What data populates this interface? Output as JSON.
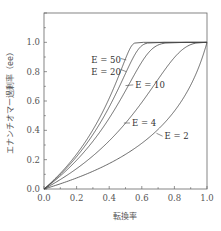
{
  "chart_data": {
    "type": "line",
    "title": "",
    "xlabel": "転換率",
    "ylabel": "エナンチオマー過剰率（ee）",
    "xlim": [
      0.0,
      1.0
    ],
    "ylim": [
      0.0,
      1.2
    ],
    "xticks": [
      "0.0",
      "0.2",
      "0.4",
      "0.6",
      "0.8",
      "1.0"
    ],
    "yticks": [
      "0.0",
      "0.2",
      "0.4",
      "0.6",
      "0.8",
      "1.0"
    ],
    "grid": false,
    "legend": "inline labels",
    "series": [
      {
        "name": "E = 50",
        "E": 50,
        "x": [
          0,
          0.063,
          0.154,
          0.243,
          0.331,
          0.419,
          0.508,
          0.551,
          0.574,
          0.6,
          1.0
        ],
        "y": [
          0,
          0.1,
          0.25,
          0.4,
          0.55,
          0.7,
          0.85,
          0.93,
          0.97,
          1.0,
          1.0
        ]
      },
      {
        "name": "E = 20",
        "E": 20,
        "x": [
          0,
          0.066,
          0.161,
          0.256,
          0.351,
          0.448,
          0.552,
          0.611,
          0.649,
          0.7,
          1.0
        ],
        "y": [
          0,
          0.1,
          0.25,
          0.4,
          0.55,
          0.7,
          0.85,
          0.93,
          0.97,
          0.995,
          1.0
        ]
      },
      {
        "name": "E = 10",
        "E": 10,
        "x": [
          0,
          0.072,
          0.176,
          0.279,
          0.385,
          0.496,
          0.625,
          0.707,
          0.768,
          0.85,
          1.0
        ],
        "y": [
          0,
          0.1,
          0.25,
          0.4,
          0.55,
          0.7,
          0.85,
          0.93,
          0.97,
          0.995,
          1.0
        ]
      },
      {
        "name": "E = 4",
        "E": 4,
        "x": [
          0,
          0.096,
          0.232,
          0.366,
          0.503,
          0.645,
          0.8,
          0.888,
          0.938,
          0.985,
          1.0
        ],
        "y": [
          0,
          0.1,
          0.25,
          0.4,
          0.55,
          0.7,
          0.85,
          0.93,
          0.97,
          0.995,
          1.0
        ]
      },
      {
        "name": "E = 2",
        "E": 2,
        "x": [
          0,
          0.174,
          0.36,
          0.694,
          0.844,
          0.938,
          0.98,
          1.0
        ],
        "y": [
          0,
          0.1,
          0.2,
          0.4,
          0.6,
          0.8,
          0.9,
          1.0
        ]
      }
    ],
    "annotations": [
      {
        "text": "E = 50",
        "x": 0.29,
        "y": 0.88
      },
      {
        "text": "E = 20",
        "x": 0.29,
        "y": 0.8
      },
      {
        "text": "E = 10",
        "x": 0.56,
        "y": 0.71
      },
      {
        "text": "E = 4",
        "x": 0.54,
        "y": 0.45
      },
      {
        "text": "E = 2",
        "x": 0.74,
        "y": 0.36
      }
    ]
  }
}
